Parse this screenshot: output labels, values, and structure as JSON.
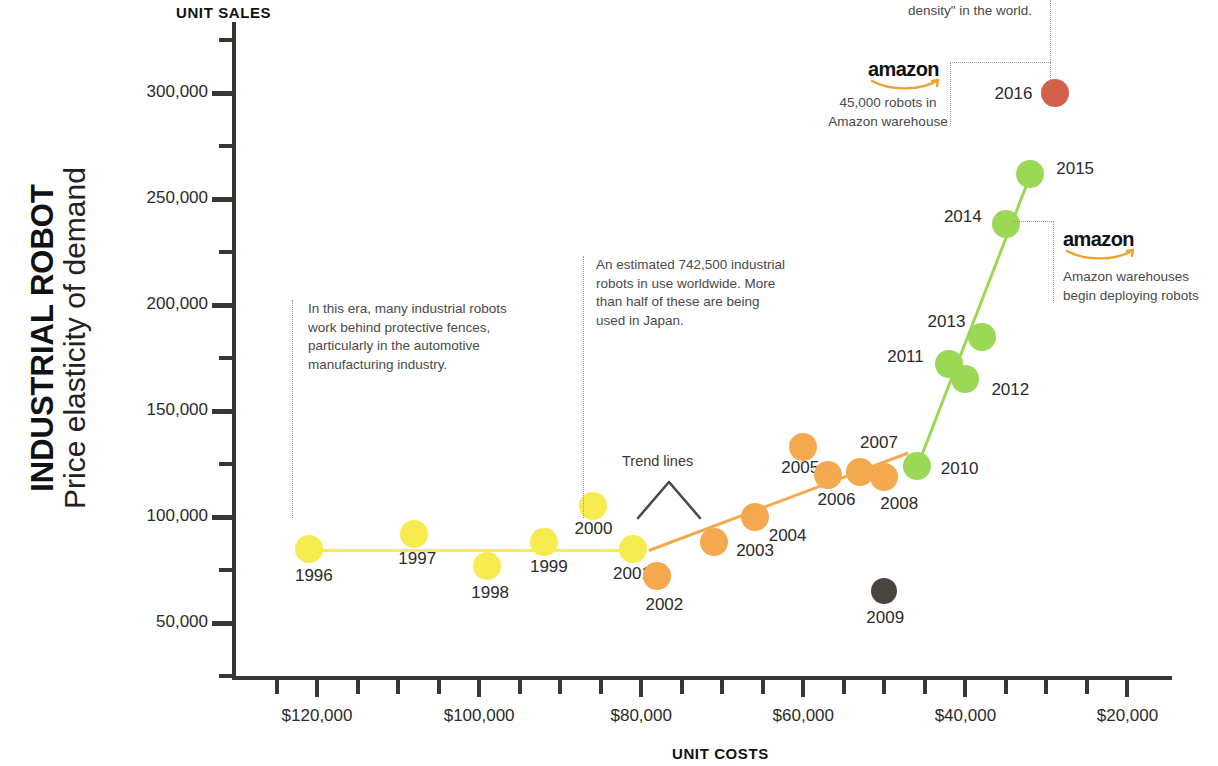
{
  "title": {
    "main": "INDUSTRIAL ROBOT",
    "sub": "Price elasticity of demand"
  },
  "axes": {
    "y_axis_name": "UNIT SALES",
    "x_axis_name": "UNIT COSTS",
    "y_ticks": [
      "300,000",
      "250,000",
      "200,000",
      "150,000",
      "100,000",
      "50,000"
    ],
    "x_ticks": [
      "$120,000",
      "$100,000",
      "$80,000",
      "$60,000",
      "$40,000",
      "$20,000"
    ]
  },
  "labels": {
    "trend_lines": "Trend lines"
  },
  "annotations": {
    "era_note": "In this era, many industrial robots\nwork behind protective fences,\nparticularly in the automotive\nmanufacturing industry.",
    "japan_note": "An estimated 742,500 industrial\nrobots in use worldwide. More\nthan half of these are being\nused in Japan.",
    "density_note": "density\" in the world.",
    "amazon_warehouse_note": "45,000 robots in\nAmazon warehouse",
    "amazon_deploy_note": "Amazon warehouses\nbegin deploying robots",
    "amazon_wordmark": "amazon"
  },
  "colors": {
    "yellow": "#f7ec4f",
    "orange": "#f5a94e",
    "gray": "#4a453f",
    "green": "#9bd855",
    "red": "#d4604a",
    "amazon_swoosh": "#f0a22e",
    "axis": "#3a3632"
  },
  "chart_data": {
    "type": "scatter",
    "xlabel": "UNIT COSTS",
    "ylabel": "UNIT SALES",
    "x_reversed": true,
    "xlim": [
      130000,
      15000
    ],
    "ylim": [
      25000,
      325000
    ],
    "grid": false,
    "legend": "none",
    "points": [
      {
        "label": "1996",
        "x": 121000,
        "y": 85000,
        "color": "#f7ec4f",
        "era": "yellow"
      },
      {
        "label": "1997",
        "x": 108000,
        "y": 92000,
        "color": "#f7ec4f",
        "era": "yellow"
      },
      {
        "label": "1998",
        "x": 99000,
        "y": 77000,
        "color": "#f7ec4f",
        "era": "yellow"
      },
      {
        "label": "1999",
        "x": 92000,
        "y": 88000,
        "color": "#f7ec4f",
        "era": "yellow"
      },
      {
        "label": "2000",
        "x": 86000,
        "y": 105000,
        "color": "#f7ec4f",
        "era": "yellow"
      },
      {
        "label": "2001",
        "x": 81000,
        "y": 85000,
        "color": "#f7ec4f",
        "era": "yellow"
      },
      {
        "label": "2002",
        "x": 78000,
        "y": 72000,
        "color": "#f5a94e",
        "era": "orange"
      },
      {
        "label": "2003",
        "x": 71000,
        "y": 88000,
        "color": "#f5a94e",
        "era": "orange"
      },
      {
        "label": "2004",
        "x": 66000,
        "y": 100000,
        "color": "#f5a94e",
        "era": "orange"
      },
      {
        "label": "2005",
        "x": 60000,
        "y": 133000,
        "color": "#f5a94e",
        "era": "orange"
      },
      {
        "label": "2006",
        "x": 57000,
        "y": 120000,
        "color": "#f5a94e",
        "era": "orange"
      },
      {
        "label": "2007",
        "x": 53000,
        "y": 121000,
        "color": "#f5a94e",
        "era": "orange"
      },
      {
        "label": "2008",
        "x": 50000,
        "y": 119000,
        "color": "#f5a94e",
        "era": "orange"
      },
      {
        "label": "2009",
        "x": 50000,
        "y": 65000,
        "color": "#4a453f",
        "era": "gray"
      },
      {
        "label": "2010",
        "x": 46000,
        "y": 124000,
        "color": "#9bd855",
        "era": "green"
      },
      {
        "label": "2011",
        "x": 42000,
        "y": 172000,
        "color": "#9bd855",
        "era": "green"
      },
      {
        "label": "2012",
        "x": 40000,
        "y": 165000,
        "color": "#9bd855",
        "era": "green"
      },
      {
        "label": "2013",
        "x": 38000,
        "y": 185000,
        "color": "#9bd855",
        "era": "green"
      },
      {
        "label": "2014",
        "x": 35000,
        "y": 238000,
        "color": "#9bd855",
        "era": "green"
      },
      {
        "label": "2015",
        "x": 32000,
        "y": 262000,
        "color": "#9bd855",
        "era": "green"
      },
      {
        "label": "2016",
        "x": 29000,
        "y": 300000,
        "color": "#d4604a",
        "era": "red"
      }
    ],
    "trend_lines": [
      {
        "name": "yellow-era-trend",
        "color": "#f7ec4f",
        "from": {
          "x": 121000,
          "y": 85000
        },
        "to": {
          "x": 81000,
          "y": 85000
        }
      },
      {
        "name": "orange-era-trend",
        "color": "#f5a94e",
        "from": {
          "x": 79000,
          "y": 85000
        },
        "to": {
          "x": 47000,
          "y": 131000
        }
      },
      {
        "name": "green-era-trend",
        "color": "#9bd855",
        "from": {
          "x": 46000,
          "y": 124000
        },
        "to": {
          "x": 32000,
          "y": 262000
        }
      }
    ]
  }
}
